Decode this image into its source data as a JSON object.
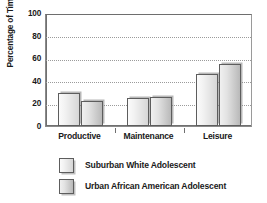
{
  "chart_data": {
    "type": "bar",
    "title": "",
    "subtitle": "",
    "xlabel": "",
    "ylabel": "Percentage of Time Spent",
    "categories": [
      "Productive",
      "Maintenance",
      "Leisure"
    ],
    "series": [
      {
        "name": "Suburban White Adolescent",
        "values": [
          29,
          24,
          46
        ],
        "color": "#ededed"
      },
      {
        "name": "Urban African American Adolescent",
        "values": [
          22,
          25,
          54
        ],
        "color": "#dcdcdc"
      }
    ],
    "ylim": [
      0,
      100
    ],
    "yticks": [
      0,
      20,
      40,
      60,
      80,
      100
    ],
    "ytick_labels": [
      "0",
      "20",
      "40",
      "60",
      "80",
      "100"
    ],
    "grid": true,
    "grid_axis": "y",
    "grid_style": "dotted",
    "legend_position": "below",
    "bar_style": {
      "edge_color": "#5d5d5d",
      "shadow": true,
      "gradient": true
    }
  },
  "legend": {
    "entries": [
      {
        "label": "Suburban White Adolescent",
        "swatch": "series-0-swatch"
      },
      {
        "label": "Urban African American Adolescent",
        "swatch": "series-1-swatch"
      }
    ]
  }
}
